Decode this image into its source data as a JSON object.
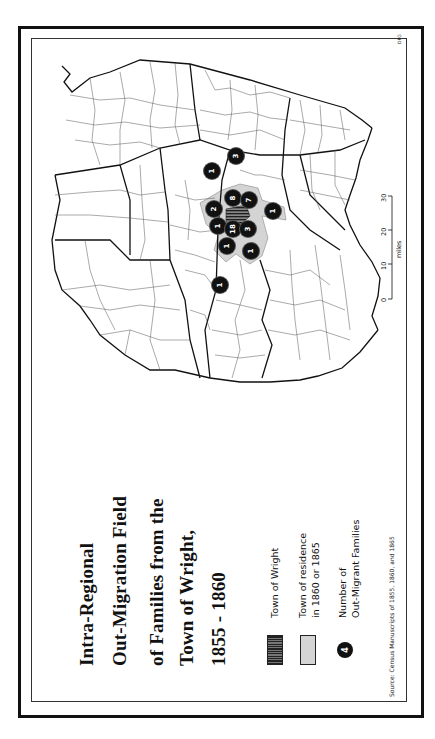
{
  "title": {
    "lines": [
      "Intra-Regional",
      "Out-Migration Field",
      "of Families from the",
      "Town of Wright,",
      "1855 - 1860"
    ]
  },
  "legend": {
    "items": [
      {
        "key": "town-of-wright",
        "label_lines": [
          "Town of Wright"
        ],
        "fill": "#444444",
        "pattern": "hatched"
      },
      {
        "key": "town-of-residence",
        "label_lines": [
          "Town of residence",
          "in 1860 or 1865"
        ],
        "fill": "#d4d4d4"
      },
      {
        "key": "out-migrant-count",
        "label_lines": [
          "Number of",
          "Out-Migrant Families"
        ],
        "symbol_value": "4",
        "fill": "#111111"
      }
    ]
  },
  "source": "Source: Census Manuscripts of 1855, 1860, and 1865",
  "credit": "DPG",
  "scale": {
    "unit": "miles",
    "ticks": [
      "0",
      "10",
      "20",
      "30"
    ]
  },
  "map": {
    "markers": [
      {
        "value": "3",
        "x": 236,
        "y": 156
      },
      {
        "value": "1",
        "x": 212,
        "y": 171
      },
      {
        "value": "8",
        "x": 233,
        "y": 198
      },
      {
        "value": "7",
        "x": 249,
        "y": 200
      },
      {
        "value": "2",
        "x": 214,
        "y": 209
      },
      {
        "value": "1",
        "x": 273,
        "y": 211
      },
      {
        "value": "1",
        "x": 218,
        "y": 226
      },
      {
        "value": "18",
        "x": 233,
        "y": 229
      },
      {
        "value": "3",
        "x": 248,
        "y": 229
      },
      {
        "value": "1",
        "x": 227,
        "y": 246
      },
      {
        "value": "1",
        "x": 251,
        "y": 251
      },
      {
        "value": "1",
        "x": 220,
        "y": 285
      }
    ],
    "colors": {
      "outline": "#111111",
      "county_line": "#555555",
      "residence_fill": "#d4d4d4",
      "wright_fill": "#555555",
      "marker_fill": "#111111"
    }
  }
}
